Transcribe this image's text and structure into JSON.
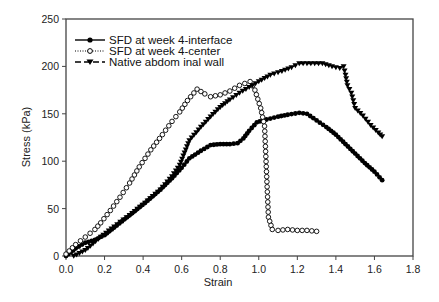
{
  "chart_data": {
    "type": "line",
    "title": "",
    "xlabel": "Strain",
    "ylabel": "Stress (kPa)",
    "xlim": [
      0.0,
      1.8
    ],
    "ylim": [
      0,
      250
    ],
    "xticks": [
      0.0,
      0.2,
      0.4,
      0.6,
      0.8,
      1.0,
      1.2,
      1.4,
      1.6,
      1.8
    ],
    "xtick_labels": [
      "0.0",
      "0.2",
      "0.4",
      "0.6",
      "0.8",
      "1.0",
      "1.2",
      "1.4",
      "1.6",
      "1.8"
    ],
    "yticks": [
      0,
      50,
      100,
      150,
      200,
      250
    ],
    "ytick_labels": [
      "0",
      "50",
      "100",
      "150",
      "200",
      "250"
    ],
    "grid": false,
    "legend_position": "upper left",
    "series": [
      {
        "name": "SFD at week 4-interface",
        "marker": "filled-circle",
        "line_style": "solid",
        "color": "#000000",
        "x": [
          0.0,
          0.05,
          0.1,
          0.15,
          0.2,
          0.25,
          0.33,
          0.41,
          0.49,
          0.55,
          0.6,
          0.64,
          0.7,
          0.75,
          0.8,
          0.85,
          0.89,
          0.92,
          0.95,
          0.99,
          1.02,
          1.06,
          1.1,
          1.15,
          1.21,
          1.25,
          1.3,
          1.35,
          1.4,
          1.45,
          1.5,
          1.55,
          1.6,
          1.64
        ],
        "y": [
          0,
          8,
          14,
          17,
          22,
          30,
          43,
          56,
          70,
          82,
          93,
          103,
          111,
          117,
          118,
          118,
          119,
          124,
          132,
          141,
          143,
          145,
          147,
          149,
          151,
          150,
          143,
          136,
          128,
          118,
          108,
          98,
          89,
          80
        ]
      },
      {
        "name": "SFD at week 4-center",
        "marker": "open-circle",
        "line_style": "dotted",
        "color": "#000000",
        "x": [
          0.0,
          0.05,
          0.1,
          0.15,
          0.18,
          0.23,
          0.28,
          0.33,
          0.38,
          0.44,
          0.5,
          0.55,
          0.59,
          0.63,
          0.68,
          0.72,
          0.75,
          0.8,
          0.85,
          0.9,
          0.955,
          0.98,
          1.01,
          1.03,
          1.05,
          1.07,
          1.1,
          1.15,
          1.2,
          1.25,
          1.3
        ],
        "y": [
          2,
          12,
          20,
          28,
          35,
          48,
          62,
          77,
          94,
          112,
          128,
          142,
          152,
          164,
          176,
          171,
          168,
          170,
          174,
          180,
          184,
          175,
          156,
          137,
          41,
          28,
          27,
          28,
          27,
          27,
          26
        ]
      },
      {
        "name": "Native abdom inal wall",
        "marker": "filled-triangle-down",
        "line_style": "dashed",
        "color": "#000000",
        "x": [
          0.04,
          0.1,
          0.18,
          0.25,
          0.33,
          0.41,
          0.49,
          0.55,
          0.59,
          0.64,
          0.7,
          0.75,
          0.8,
          0.85,
          0.9,
          0.95,
          1.0,
          1.06,
          1.12,
          1.17,
          1.21,
          1.27,
          1.33,
          1.38,
          1.42,
          1.44,
          1.45,
          1.46,
          1.48,
          1.5,
          1.54,
          1.58,
          1.62,
          1.64
        ],
        "y": [
          0,
          6,
          20,
          31,
          43,
          56,
          70,
          84,
          96,
          122,
          136,
          147,
          157,
          165,
          172,
          178,
          184,
          191,
          195,
          199,
          203,
          203,
          203,
          200,
          198,
          200,
          191,
          180,
          172,
          156,
          148,
          138,
          130,
          126
        ]
      }
    ]
  }
}
